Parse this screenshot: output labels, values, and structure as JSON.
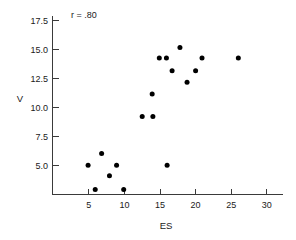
{
  "chart_data": {
    "type": "scatter",
    "title": "",
    "xlabel": "ES",
    "ylabel": "V",
    "xlim": [
      1,
      31.5
    ],
    "ylim": [
      2.0,
      18.6
    ],
    "grid": false,
    "legend": null,
    "annotations": [
      {
        "text": "r = .80",
        "x": 7.6,
        "y": 18.0
      }
    ],
    "xticks": [
      5,
      10,
      15,
      20,
      25,
      30
    ],
    "xtick_labels": [
      "5",
      "10",
      "15",
      "20",
      "25",
      "30"
    ],
    "yticks": [
      5.0,
      7.5,
      10.0,
      12.5,
      15.0,
      17.5
    ],
    "ytick_labels": [
      "5.0",
      "7.5",
      "10.0",
      "12.5",
      "15.0",
      "17.5"
    ],
    "marker": "filled-circle",
    "marker_color": "#000000",
    "points": [
      {
        "x": 4.9,
        "y": 5.05
      },
      {
        "x": 5.9,
        "y": 2.95
      },
      {
        "x": 6.8,
        "y": 6.05
      },
      {
        "x": 7.9,
        "y": 4.15
      },
      {
        "x": 8.9,
        "y": 5.05
      },
      {
        "x": 9.9,
        "y": 2.95
      },
      {
        "x": 12.5,
        "y": 9.25
      },
      {
        "x": 14.0,
        "y": 9.25
      },
      {
        "x": 13.9,
        "y": 11.2
      },
      {
        "x": 14.9,
        "y": 14.3
      },
      {
        "x": 15.9,
        "y": 14.3
      },
      {
        "x": 16.0,
        "y": 5.05
      },
      {
        "x": 16.7,
        "y": 13.2
      },
      {
        "x": 17.8,
        "y": 15.2
      },
      {
        "x": 18.8,
        "y": 12.2
      },
      {
        "x": 20.0,
        "y": 13.2
      },
      {
        "x": 20.9,
        "y": 14.3
      },
      {
        "x": 26.0,
        "y": 14.3
      }
    ]
  },
  "labels": {
    "y_axis_title": "V",
    "x_axis_title": "ES",
    "correlation_note": "r = .80"
  }
}
